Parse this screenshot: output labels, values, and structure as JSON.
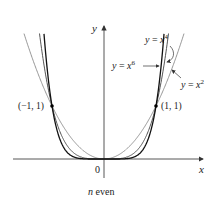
{
  "chart_data": {
    "type": "line",
    "title": "",
    "caption": "n even",
    "xlabel": "x",
    "ylabel": "y",
    "origin_label": "0",
    "grid": false,
    "legend": "inline annotations",
    "series": [
      {
        "name": "y = x^2",
        "label_main": "y = x",
        "exponent": "2",
        "formula": "x^2",
        "color": "#8a8a8a",
        "width": 0.9
      },
      {
        "name": "y = x^4",
        "label_main": "y = x",
        "exponent": "4",
        "formula": "x^4",
        "color": "#555555",
        "width": 1.0
      },
      {
        "name": "y = x^6",
        "label_main": "y = x",
        "exponent": "6",
        "formula": "x^6",
        "color": "#111111",
        "width": 1.3
      }
    ],
    "points": [
      {
        "label": "(−1, 1)",
        "x": -1,
        "y": 1
      },
      {
        "label": "(1, 1)",
        "x": 1,
        "y": 1
      }
    ],
    "xlim": [
      -1.75,
      1.9
    ],
    "ylim": [
      -0.35,
      2.55
    ]
  }
}
